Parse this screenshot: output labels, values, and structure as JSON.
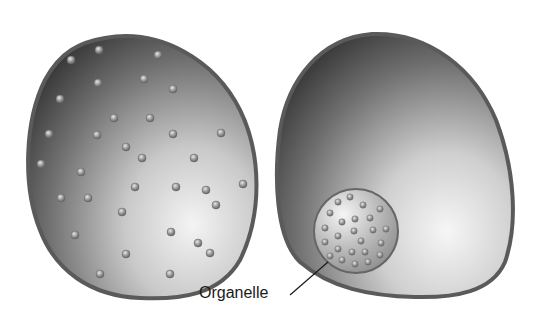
{
  "figure": {
    "left_cell": {
      "name": "cell-with-dispersed-particles",
      "particle_count": 33
    },
    "right_cell": {
      "name": "cell-with-organelle",
      "organelle_particle_count": 24
    },
    "labels": {
      "organelle": "Organelle"
    },
    "colors": {
      "cell_dark": "#3a3a3a",
      "cell_light": "#f0f0f0",
      "outline": "#555555",
      "particle": "#8a8a8a"
    }
  }
}
